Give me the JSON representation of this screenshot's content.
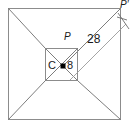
{
  "figure": {
    "type": "geometry-diagram",
    "width": 135,
    "height": 128,
    "colors": {
      "stroke": "#8c8c8c",
      "stroke_dark": "#4d4d4d",
      "label": "#1a1a1a",
      "background": "#ffffff",
      "center_dot": "#000000"
    },
    "outer_square": {
      "x": 8,
      "y": 8,
      "size": 113
    },
    "inner_square": {
      "x": 45,
      "y": 48,
      "size": 33
    },
    "center_point": {
      "x": 63,
      "y": 66
    }
  },
  "labels": {
    "center": "C",
    "inner_length": "8",
    "apex": "P",
    "apex_prime": "P",
    "apex_prime_mark": "′",
    "distance": "28"
  }
}
